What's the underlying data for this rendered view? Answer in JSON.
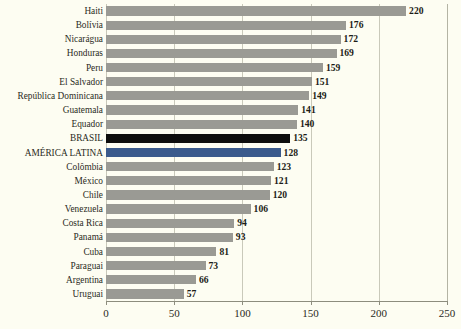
{
  "chart_data": {
    "type": "bar",
    "orientation": "horizontal",
    "title": "",
    "subtitle": "",
    "xlabel": "",
    "ylabel": "",
    "xlim": [
      0,
      250
    ],
    "xticks": [
      0,
      50,
      100,
      150,
      200,
      250
    ],
    "xtick_labels": [
      "0",
      "50",
      "100",
      "150",
      "200",
      "250"
    ],
    "grid": true,
    "grid_axis": "x",
    "legend": false,
    "categories": [
      "Haiti",
      "Bolívia",
      "Nicarágua",
      "Honduras",
      "Peru",
      "El Salvador",
      "República Dominicana",
      "Guatemala",
      "Equador",
      "BRASIL",
      "AMÉRICA LATINA",
      "Colômbia",
      "México",
      "Chile",
      "Venezuela",
      "Costa Rica",
      "Panamá",
      "Cuba",
      "Paraguai",
      "Argentina",
      "Uruguai"
    ],
    "values": [
      220,
      176,
      172,
      169,
      159,
      151,
      149,
      141,
      140,
      135,
      128,
      123,
      121,
      120,
      106,
      94,
      93,
      81,
      73,
      66,
      57
    ],
    "value_labels": [
      "220",
      "176",
      "172",
      "169",
      "159",
      "151",
      "149",
      "141",
      "140",
      "135",
      "128",
      "123",
      "121",
      "120",
      "106",
      "94",
      "93",
      "81",
      "73",
      "66",
      "57"
    ],
    "bar_styles": [
      "default",
      "default",
      "default",
      "default",
      "default",
      "default",
      "default",
      "default",
      "default",
      "brasil",
      "region",
      "default",
      "default",
      "default",
      "default",
      "default",
      "default",
      "default",
      "default",
      "default",
      "default"
    ],
    "colors": {
      "bar_default": "#9a9a94",
      "bar_brasil": "#0d0d0d",
      "bar_region": "#3a5a8c",
      "background": "#fdfdf2",
      "gridline": "#c9c9ba",
      "axis": "#8d8d7e",
      "text": "#2a2a22"
    }
  }
}
